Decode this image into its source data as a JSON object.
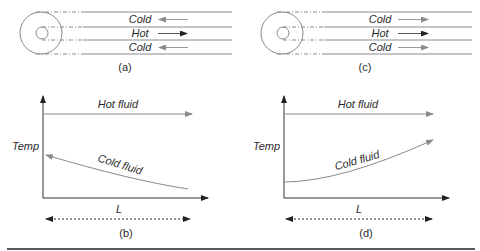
{
  "colors": {
    "line": "#8a8a8a",
    "axis": "#333333",
    "text": "#2a2a2a",
    "rule": "#222222"
  },
  "panels": {
    "a": {
      "caption": "(a)",
      "flow_type": "counter-flow",
      "channels": [
        {
          "label": "Cold",
          "direction": "left"
        },
        {
          "label": "Hot",
          "direction": "right"
        },
        {
          "label": "Cold",
          "direction": "left"
        }
      ]
    },
    "c": {
      "caption": "(c)",
      "flow_type": "parallel-flow",
      "channels": [
        {
          "label": "Cold",
          "direction": "right"
        },
        {
          "label": "Hot",
          "direction": "right"
        },
        {
          "label": "Cold",
          "direction": "right"
        }
      ]
    },
    "b": {
      "caption": "(b)",
      "y_label": "Temp",
      "x_label": "L",
      "hot_label": "Hot fluid",
      "cold_label": "Cold fluid",
      "cold_trend": "decreasing along L (arrow points toward inlet, left)"
    },
    "d": {
      "caption": "(d)",
      "y_label": "Temp",
      "x_label": "L",
      "hot_label": "Hot fluid",
      "cold_label": "Cold fluid",
      "cold_trend": "increasing along L (arrow points right)"
    }
  }
}
